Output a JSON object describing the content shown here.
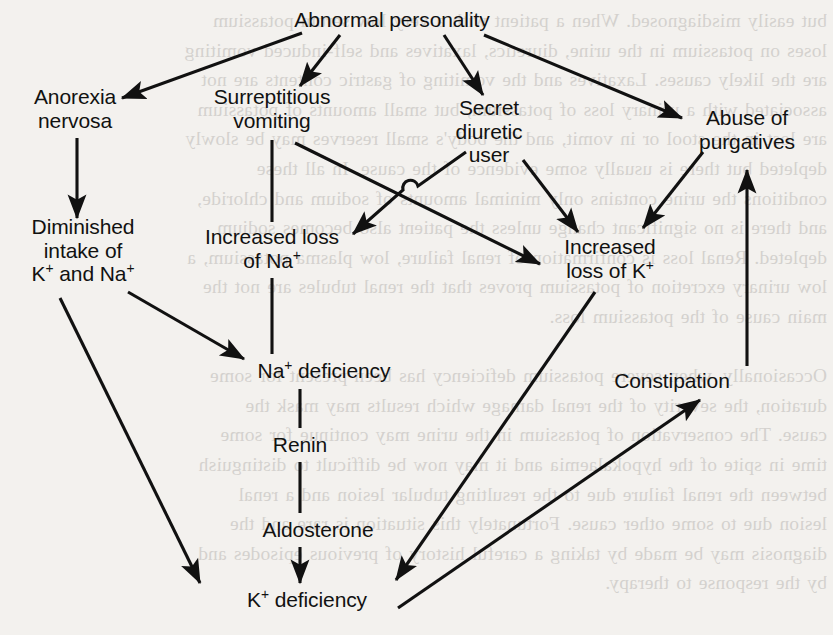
{
  "diagram": {
    "type": "flowchart",
    "background_color": "#f3f1ee",
    "ink_color": "#111111",
    "nodes": [
      {
        "id": "abnormal-personality",
        "label": "Abnormal personality",
        "x": 392,
        "y": 20
      },
      {
        "id": "anorexia-nervosa",
        "label": "Anorexia\nnervosa",
        "x": 75,
        "y": 108
      },
      {
        "id": "surreptitious-vomiting",
        "label": "Surreptitious\nvomiting",
        "x": 272,
        "y": 108
      },
      {
        "id": "secret-diuretic-user",
        "label": "Secret\ndiuretic\nuser",
        "x": 489,
        "y": 131
      },
      {
        "id": "abuse-of-purgatives",
        "label": "Abuse of\npurgatives",
        "x": 747,
        "y": 129
      },
      {
        "id": "diminished-intake",
        "label": "Diminished\nintake of\nK+ and Na+",
        "x": 83,
        "y": 250
      },
      {
        "id": "increased-loss-na",
        "label": "Increased loss\nof Na+",
        "x": 272,
        "y": 248
      },
      {
        "id": "increased-loss-k",
        "label": "Increased\nloss of K+",
        "x": 610,
        "y": 258
      },
      {
        "id": "na-deficiency",
        "label": "Na+ deficiency",
        "x": 324,
        "y": 371
      },
      {
        "id": "renin",
        "label": "Renin",
        "x": 300,
        "y": 445
      },
      {
        "id": "aldosterone",
        "label": "Aldosterone",
        "x": 318,
        "y": 530
      },
      {
        "id": "k-deficiency",
        "label": "K+ deficiency",
        "x": 307,
        "y": 600
      },
      {
        "id": "constipation",
        "label": "Constipation",
        "x": 672,
        "y": 381
      }
    ],
    "edges": [
      {
        "from": "abnormal-personality",
        "to": "anorexia-nervosa",
        "arrow": true
      },
      {
        "from": "abnormal-personality",
        "to": "surreptitious-vomiting",
        "arrow": true
      },
      {
        "from": "abnormal-personality",
        "to": "secret-diuretic-user",
        "arrow": true
      },
      {
        "from": "abnormal-personality",
        "to": "abuse-of-purgatives",
        "arrow": true
      },
      {
        "from": "anorexia-nervosa",
        "to": "diminished-intake",
        "arrow": true
      },
      {
        "from": "surreptitious-vomiting",
        "to": "increased-loss-na",
        "arrow": false
      },
      {
        "from": "surreptitious-vomiting",
        "to": "increased-loss-k",
        "arrow": true,
        "crosses": true
      },
      {
        "from": "secret-diuretic-user",
        "to": "increased-loss-na",
        "arrow": true,
        "crosses": true,
        "hop": true
      },
      {
        "from": "secret-diuretic-user",
        "to": "increased-loss-k",
        "arrow": true
      },
      {
        "from": "abuse-of-purgatives",
        "to": "increased-loss-k",
        "arrow": true
      },
      {
        "from": "diminished-intake",
        "to": "na-deficiency",
        "arrow": true
      },
      {
        "from": "diminished-intake",
        "to": "k-deficiency",
        "arrow": true
      },
      {
        "from": "increased-loss-na",
        "to": "na-deficiency",
        "arrow": false
      },
      {
        "from": "na-deficiency",
        "to": "renin",
        "arrow": false
      },
      {
        "from": "renin",
        "to": "aldosterone",
        "arrow": false
      },
      {
        "from": "aldosterone",
        "to": "k-deficiency",
        "arrow": true
      },
      {
        "from": "increased-loss-k",
        "to": "k-deficiency",
        "arrow": true
      },
      {
        "from": "k-deficiency",
        "to": "constipation",
        "arrow": true
      },
      {
        "from": "constipation",
        "to": "abuse-of-purgatives",
        "arrow": true
      }
    ]
  },
  "background_text": {
    "lines": "but easily misdiagnosed. When a patient with a very low serum potassium\nloses on potassium in the urine, diuretics, laxatives and self-induced vomiting\nare the likely causes. Laxatives and the vomiting of gastric contents are not\nassociated with a urinary loss of potassium, but small amounts of potassium\nare lost in the stool or in vomit, and the body's small reserves may be slowly\ndepleted but there is usually some evidence of the cause. In all these\nconditions the urine contains only minimal amounts of sodium and chloride,\nand there is no significant change unless the patient also becomes sodium\ndepleted. Renal loss is confirmation of renal failure, low plasma potassium, a\nlow urinary excretion of potassium proves that the renal tubules are not the\nmain cause of the potassium loss.\n\nOccasionally, when severe potassium deficiency has been present for some\nduration, the severity of the renal damage which results may mask the\ncause. The conservation of potassium in the urine may continue for some\ntime in spite of the hypokalaemia and it may now be difficult to distinguish\nbetween the renal failure due to the resulting tubular lesion and a renal\nlesion due to some other cause. Fortunately this situation is rare and the\ndiagnosis may be made by taking a careful history of previous episodes and\nby the response to therapy."
  }
}
